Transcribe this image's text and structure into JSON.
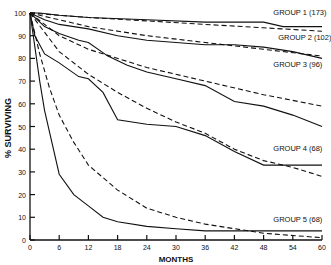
{
  "chart_data": {
    "type": "line",
    "title": "",
    "xlabel": "MONTHS",
    "ylabel": "% SURVIVING",
    "xlim": [
      0,
      60
    ],
    "ylim": [
      0,
      100
    ],
    "x_ticks": [
      0,
      6,
      12,
      18,
      24,
      30,
      36,
      42,
      48,
      54,
      60
    ],
    "y_ticks": [
      0,
      10,
      20,
      30,
      40,
      50,
      60,
      70,
      80,
      90,
      100
    ],
    "grid": false,
    "legend": "inline labels",
    "series": [
      {
        "name": "GROUP 1 (173)",
        "style": "solid",
        "x": [
          0,
          2,
          6,
          12,
          24,
          36,
          48,
          52,
          60
        ],
        "y": [
          100,
          100,
          99,
          98,
          97,
          96,
          96,
          94,
          94
        ]
      },
      {
        "name": "GROUP 1 (173) expected",
        "style": "dashed",
        "x": [
          0,
          12,
          24,
          36,
          48,
          60
        ],
        "y": [
          100,
          98,
          96.5,
          95,
          93.5,
          92
        ]
      },
      {
        "name": "GROUP 2 (102)",
        "style": "solid",
        "x": [
          0,
          3,
          6,
          12,
          18,
          24,
          30,
          36,
          42,
          48,
          54,
          60
        ],
        "y": [
          100,
          97,
          95,
          93,
          90,
          88,
          87,
          86,
          86,
          85,
          83,
          80
        ]
      },
      {
        "name": "GROUP 2 (102) expected",
        "style": "dashed",
        "x": [
          0,
          12,
          24,
          36,
          48,
          60
        ],
        "y": [
          100,
          94,
          90,
          87,
          84,
          81
        ]
      },
      {
        "name": "GROUP 3 (96)",
        "style": "solid",
        "x": [
          0,
          3,
          6,
          10,
          12,
          16,
          20,
          24,
          30,
          36,
          42,
          48,
          54,
          60
        ],
        "y": [
          100,
          94,
          91,
          88,
          87,
          81,
          77,
          74,
          71,
          68,
          61,
          59,
          55,
          50
        ]
      },
      {
        "name": "GROUP 3 (96) expected",
        "style": "dashed",
        "x": [
          0,
          6,
          12,
          24,
          36,
          48,
          60
        ],
        "y": [
          100,
          90,
          84,
          76,
          70,
          64,
          59
        ]
      },
      {
        "name": "GROUP 4 (68)",
        "style": "solid",
        "x": [
          0,
          1,
          3,
          6,
          10,
          12,
          15,
          18,
          24,
          30,
          36,
          42,
          48,
          54,
          60
        ],
        "y": [
          100,
          90,
          82,
          78,
          72,
          71,
          65,
          53,
          51,
          50,
          46,
          39,
          33,
          33,
          33
        ]
      },
      {
        "name": "GROUP 4 (68) expected",
        "style": "dashed",
        "x": [
          0,
          6,
          12,
          18,
          24,
          30,
          36,
          42,
          48,
          54,
          60
        ],
        "y": [
          100,
          83,
          73,
          65,
          58,
          52,
          47,
          40,
          35,
          32,
          28
        ]
      },
      {
        "name": "GROUP 5 (68)",
        "style": "solid",
        "x": [
          0,
          1,
          2,
          3,
          6,
          9,
          12,
          15,
          18,
          24,
          30,
          36,
          42,
          48,
          54,
          60
        ],
        "y": [
          100,
          85,
          70,
          57,
          29,
          20,
          15,
          10,
          8,
          6,
          5,
          4,
          4,
          4,
          4,
          4
        ]
      },
      {
        "name": "GROUP 5 (68) expected",
        "style": "dashed",
        "x": [
          0,
          2,
          4,
          6,
          9,
          12,
          18,
          24,
          30,
          36,
          42,
          48,
          54,
          60
        ],
        "y": [
          100,
          82,
          67,
          55,
          43,
          33,
          22,
          14,
          10,
          7,
          5,
          3,
          2,
          1
        ]
      }
    ],
    "labels": [
      {
        "text": "GROUP 1 (173)",
        "x": 50,
        "y": 99
      },
      {
        "text": "GROUP 2 (102)",
        "x": 51,
        "y": 88
      },
      {
        "text": "GROUP 3 (96)",
        "x": 50,
        "y": 76
      },
      {
        "text": "GROUP 4 (68)",
        "x": 50,
        "y": 39
      },
      {
        "text": "GROUP 5 (68)",
        "x": 50,
        "y": 8
      }
    ]
  }
}
